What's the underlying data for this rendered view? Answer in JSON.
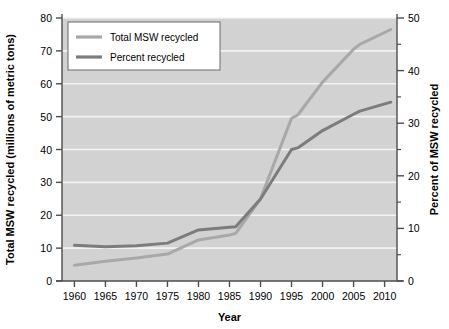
{
  "chart_data": {
    "type": "line",
    "title": "",
    "xlabel": "Year",
    "ylabel": "Total MSW recycled (millions of metric tons)",
    "y2label": "Percent of MSW recycled",
    "xlim": [
      1958,
      2012
    ],
    "ylim": [
      0,
      80
    ],
    "y2lim": [
      0,
      50
    ],
    "grid": true,
    "grid_orientation": "horizontal",
    "legend_position": "top-left",
    "xticks": [
      1960,
      1965,
      1970,
      1975,
      1980,
      1985,
      1990,
      1995,
      2000,
      2005,
      2010
    ],
    "xtick_labels": [
      "1960",
      "1965",
      "1970",
      "1975",
      "1980",
      "1985",
      "1990",
      "1995",
      "2000",
      "2005",
      "2010"
    ],
    "yticks": [
      0,
      10,
      20,
      30,
      40,
      50,
      60,
      70,
      80
    ],
    "ytick_labels": [
      "0",
      "10",
      "20",
      "30",
      "40",
      "50",
      "60",
      "70",
      "80"
    ],
    "y2ticks": [
      0,
      10,
      20,
      30,
      40,
      50
    ],
    "y2tick_labels": [
      "0",
      "10",
      "20",
      "30",
      "40",
      "50"
    ],
    "y2minorticks": [
      5,
      15,
      25,
      35,
      45
    ],
    "series": [
      {
        "name": "Total MSW recycled",
        "axis": "left",
        "units": "millions of metric tons",
        "color": "#a8a8a8",
        "x": [
          1960,
          1965,
          1970,
          1975,
          1980,
          1985,
          1986,
          1990,
          1995,
          1996,
          2000,
          2005,
          2006,
          2011
        ],
        "values": [
          4.8,
          6.0,
          7.0,
          8.2,
          12.5,
          14.0,
          14.5,
          25.0,
          49.5,
          50.5,
          60.5,
          70.5,
          72.0,
          76.5
        ]
      },
      {
        "name": "Percent recycled",
        "axis": "right",
        "units": "percent",
        "color": "#7c7c7c",
        "x": [
          1960,
          1965,
          1970,
          1975,
          1980,
          1985,
          1986,
          1990,
          1995,
          1996,
          2000,
          2005,
          2006,
          2011
        ],
        "values": [
          6.8,
          6.5,
          6.7,
          7.2,
          9.7,
          10.2,
          10.3,
          15.6,
          25.0,
          25.3,
          28.6,
          31.7,
          32.3,
          34.0
        ]
      }
    ]
  },
  "legend": {
    "entries": [
      {
        "label": "Total MSW recycled",
        "color": "#a8a8a8"
      },
      {
        "label": "Percent recycled",
        "color": "#7c7c7c"
      }
    ]
  },
  "axes": {
    "x_title": "Year",
    "y_left_title": "Total MSW recycled (millions of metric tons)",
    "y_right_title": "Percent of MSW recycled"
  },
  "colors": {
    "plot_background": "#d2d2d2",
    "grid_line": "#f2f2f2",
    "axis": "#4d4d4d",
    "total_msw_line": "#a8a8a8",
    "percent_line": "#7c7c7c",
    "page_background": "#ffffff"
  }
}
